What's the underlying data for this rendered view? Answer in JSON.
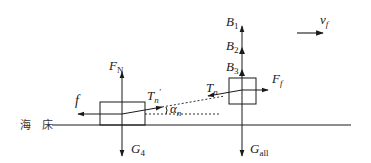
{
  "diagram": {
    "type": "force_diagram",
    "seabed_label": "海 床",
    "velocity": {
      "label": "v",
      "sub": "f"
    },
    "left_block": {
      "forces": {
        "normal": {
          "label": "F",
          "sub": "N"
        },
        "friction": {
          "label": "f"
        },
        "tension": {
          "label": "T",
          "sub": "n",
          "prime": "'"
        },
        "angle": {
          "label": "α",
          "sub": "n"
        },
        "gravity": {
          "label": "G",
          "sub": "4"
        }
      }
    },
    "right_block": {
      "forces": {
        "buoyancy_1": {
          "label": "B",
          "sub": "1"
        },
        "buoyancy_2": {
          "label": "B",
          "sub": "2"
        },
        "buoyancy_3": {
          "label": "B",
          "sub": "3"
        },
        "drag": {
          "label": "F",
          "sub": "f"
        },
        "tension": {
          "label": "T",
          "sub": "n"
        },
        "gravity": {
          "label": "G",
          "sub": "all"
        }
      }
    },
    "colors": {
      "stroke": "#1a1a1a",
      "background": "#ffffff"
    }
  }
}
